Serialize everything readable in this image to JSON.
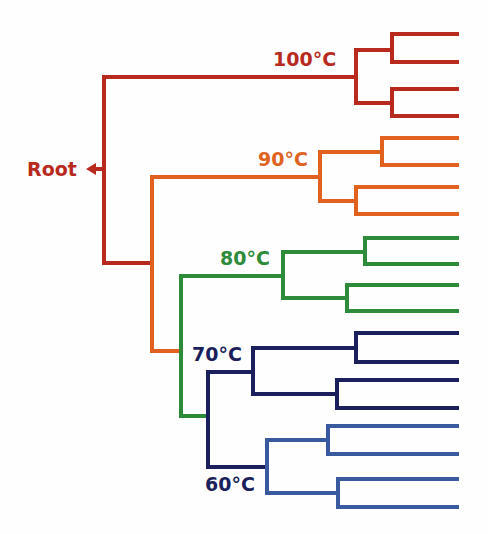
{
  "root": {
    "label": "Root",
    "color": "#B82A1E"
  },
  "clades": [
    {
      "label": "100°C",
      "color": "#B82A1E"
    },
    {
      "label": "90°C",
      "color": "#E0621E"
    },
    {
      "label": "80°C",
      "color": "#2E8B3A"
    },
    {
      "label": "70°C",
      "color": "#1B1F5C"
    },
    {
      "label": "60°C",
      "color": "#3A5AA0"
    }
  ],
  "leaf_count": 20
}
